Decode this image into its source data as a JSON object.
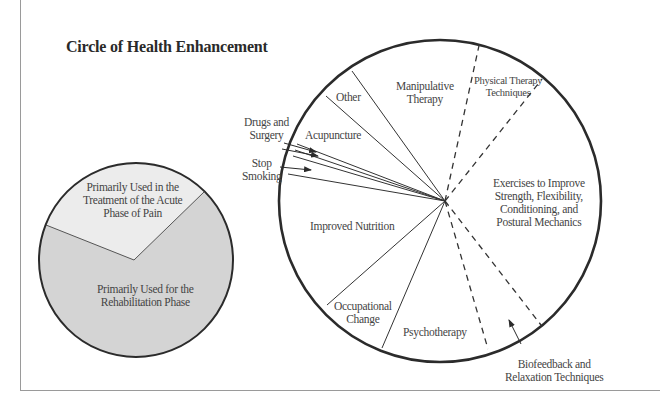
{
  "title": "Circle of Health Enhancement",
  "small_circle": {
    "segments": [
      {
        "name": "acute",
        "lines": [
          "Primarily Used in the",
          "Treatment of the Acute",
          "Phase of Pain"
        ],
        "fill": "#ececec"
      },
      {
        "name": "rehab",
        "lines": [
          "Primarily Used for the",
          "Rehabilitation Phase"
        ],
        "fill": "#d4d4d4"
      }
    ]
  },
  "large_circle": {
    "segments": [
      {
        "name": "manipulative-therapy",
        "lines": [
          "Manipulative",
          "Therapy"
        ]
      },
      {
        "name": "physical-therapy-techniques",
        "lines": [
          "Physical Therapy",
          "Techniques"
        ]
      },
      {
        "name": "exercises",
        "lines": [
          "Exercises to Improve",
          "Strength, Flexibility,",
          "Conditioning, and",
          "Postural Mechanics"
        ]
      },
      {
        "name": "psychotherapy",
        "lines": [
          "Psychotherapy"
        ]
      },
      {
        "name": "occupational-change",
        "lines": [
          "Occupational",
          "Change"
        ]
      },
      {
        "name": "improved-nutrition",
        "lines": [
          "Improved Nutrition"
        ]
      },
      {
        "name": "acupuncture",
        "lines": [
          "Acupuncture"
        ]
      },
      {
        "name": "other",
        "lines": [
          "Other"
        ]
      }
    ],
    "callouts": [
      {
        "name": "drugs-and-surgery",
        "lines": [
          "Drugs and",
          "Surgery"
        ]
      },
      {
        "name": "stop-smoking",
        "lines": [
          "Stop",
          "Smoking"
        ]
      },
      {
        "name": "biofeedback",
        "lines": [
          "Biofeedback and",
          "Relaxation Techniques"
        ]
      }
    ]
  },
  "colors": {
    "stroke": "#2b2b2b",
    "frame": "#9a9a9a",
    "acute_fill": "#ececec",
    "rehab_fill": "#d4d4d4"
  }
}
